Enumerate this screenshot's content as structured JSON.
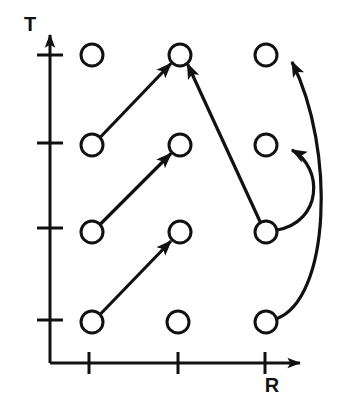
{
  "figure": {
    "background_color": "#ffffff",
    "stroke_color": "#111111",
    "node_fill": "#ffffff"
  },
  "axes": {
    "x_axis": {
      "label": "R",
      "label_x": 272,
      "label_y": 385,
      "line_y": 363,
      "line_x_start": 50,
      "line_x_end": 300,
      "arrow_tip_x": 308,
      "tick_positions": [
        89,
        178,
        265
      ],
      "tick_half_height": 11
    },
    "y_axis": {
      "label": "T",
      "label_x": 30,
      "label_y": 26,
      "line_x": 50,
      "line_y_start": 363,
      "line_y_end": 35,
      "arrow_tip_y": 22,
      "tick_positions": [
        55,
        143,
        228,
        320
      ],
      "tick_half_width": 13
    }
  },
  "nodes": [
    {
      "id": "n-c1-r1",
      "label": "",
      "cx": 92,
      "cy": 55,
      "r": 11,
      "column": 1,
      "row": 1
    },
    {
      "id": "n-c2-r1",
      "label": "",
      "cx": 180,
      "cy": 55,
      "r": 11,
      "column": 2,
      "row": 1
    },
    {
      "id": "n-c3-r1",
      "label": "",
      "cx": 266,
      "cy": 55,
      "r": 11,
      "column": 3,
      "row": 1
    },
    {
      "id": "n-c1-r2",
      "label": "",
      "cx": 92,
      "cy": 145,
      "r": 11,
      "column": 1,
      "row": 2
    },
    {
      "id": "n-c2-r2",
      "label": "",
      "cx": 180,
      "cy": 145,
      "r": 11,
      "column": 2,
      "row": 2
    },
    {
      "id": "n-c3-r2",
      "label": "",
      "cx": 266,
      "cy": 145,
      "r": 11,
      "column": 3,
      "row": 2
    },
    {
      "id": "n-c1-r3",
      "label": "",
      "cx": 92,
      "cy": 232,
      "r": 11,
      "column": 1,
      "row": 3
    },
    {
      "id": "n-c2-r3",
      "label": "",
      "cx": 180,
      "cy": 232,
      "r": 11,
      "column": 2,
      "row": 3
    },
    {
      "id": "n-c3-r3",
      "label": "",
      "cx": 266,
      "cy": 232,
      "r": 11,
      "column": 3,
      "row": 3
    },
    {
      "id": "n-c1-r4",
      "label": "",
      "cx": 92,
      "cy": 322,
      "r": 11,
      "column": 1,
      "row": 4
    },
    {
      "id": "n-c2-r4",
      "label": "",
      "cx": 178,
      "cy": 322,
      "r": 11,
      "column": 2,
      "row": 4
    },
    {
      "id": "n-c3-r4",
      "label": "",
      "cx": 266,
      "cy": 322,
      "r": 11,
      "column": 3,
      "row": 4
    }
  ],
  "edges": [
    {
      "id": "edge-1",
      "from": "n-c1-r2",
      "to": "n-c2-r1",
      "kind": "straight",
      "path": "M 100.5 137 L 171 63.5"
    },
    {
      "id": "edge-2",
      "from": "n-c1-r3",
      "to": "n-c2-r2",
      "kind": "straight",
      "path": "M 100.5 224 L 171 153.5"
    },
    {
      "id": "edge-3",
      "from": "n-c1-r4",
      "to": "n-c2-r3",
      "kind": "straight",
      "path": "M 100.5 314 L 171 241"
    },
    {
      "id": "edge-4",
      "from": "n-c3-r3",
      "to": "n-c2-r1",
      "kind": "straight",
      "path": "M 260 221.5 L 187.5 64"
    },
    {
      "id": "edge-5",
      "from": "n-c3-r4",
      "to": "n-c3-r1",
      "kind": "curved",
      "path": "M 276 319 C 330 300, 336 150, 292 62"
    },
    {
      "id": "edge-6",
      "from": "n-c3-r3",
      "to": "n-c3-r2",
      "kind": "curved",
      "path": "M 277 230 C 322 222, 324 168, 292 150"
    }
  ],
  "style": {
    "node_stroke_width": 3,
    "edge_stroke_width": 3.2,
    "axis_stroke_width": 3,
    "tick_stroke_width": 3,
    "arrow_length": 13,
    "arrow_width": 9
  }
}
